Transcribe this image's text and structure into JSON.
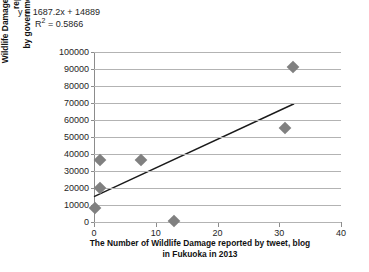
{
  "annotation": {
    "equation": "y = 1687.2x + 14889",
    "r_squared_prefix": "R",
    "r_squared_sup": "2",
    "r_squared_value": " = 0.5866"
  },
  "chart_data": {
    "type": "scatter",
    "title": "",
    "xlabel_line1": "The Number of Wildlife Damage reported by tweet, blog",
    "xlabel_line2": "in Fukuoka in 2013",
    "ylabel_line1": "Wildlife Damage of Fukuoka in 2013 reported",
    "ylabel_line2": "by government (x10000/Yen)",
    "xlim": [
      0,
      40
    ],
    "ylim": [
      0,
      100000
    ],
    "xticks": [
      0,
      10,
      20,
      30,
      40
    ],
    "yticks": [
      0,
      10000,
      20000,
      30000,
      40000,
      50000,
      60000,
      70000,
      80000,
      90000,
      100000
    ],
    "xtick_labels": [
      "0",
      "10",
      "20",
      "30",
      "40"
    ],
    "ytick_labels": [
      "0",
      "10000",
      "20000",
      "30000",
      "40000",
      "50000",
      "60000",
      "70000",
      "80000",
      "90000",
      "100000"
    ],
    "grid": "horizontal",
    "legend": "none",
    "marker_color": "#808080",
    "marker_shape": "diamond",
    "trendline_color": "#1a1a1a",
    "points": [
      {
        "x": 0.2,
        "y": 8500
      },
      {
        "x": 1.0,
        "y": 19800
      },
      {
        "x": 1.0,
        "y": 36200
      },
      {
        "x": 7.6,
        "y": 36200
      },
      {
        "x": 13.0,
        "y": 700
      },
      {
        "x": 31.0,
        "y": 55200
      },
      {
        "x": 32.2,
        "y": 91000
      }
    ],
    "trendline": {
      "slope": 1687.2,
      "intercept": 14889,
      "r_squared": 0.5866,
      "x_start": 0.0,
      "x_end": 32.4
    }
  }
}
